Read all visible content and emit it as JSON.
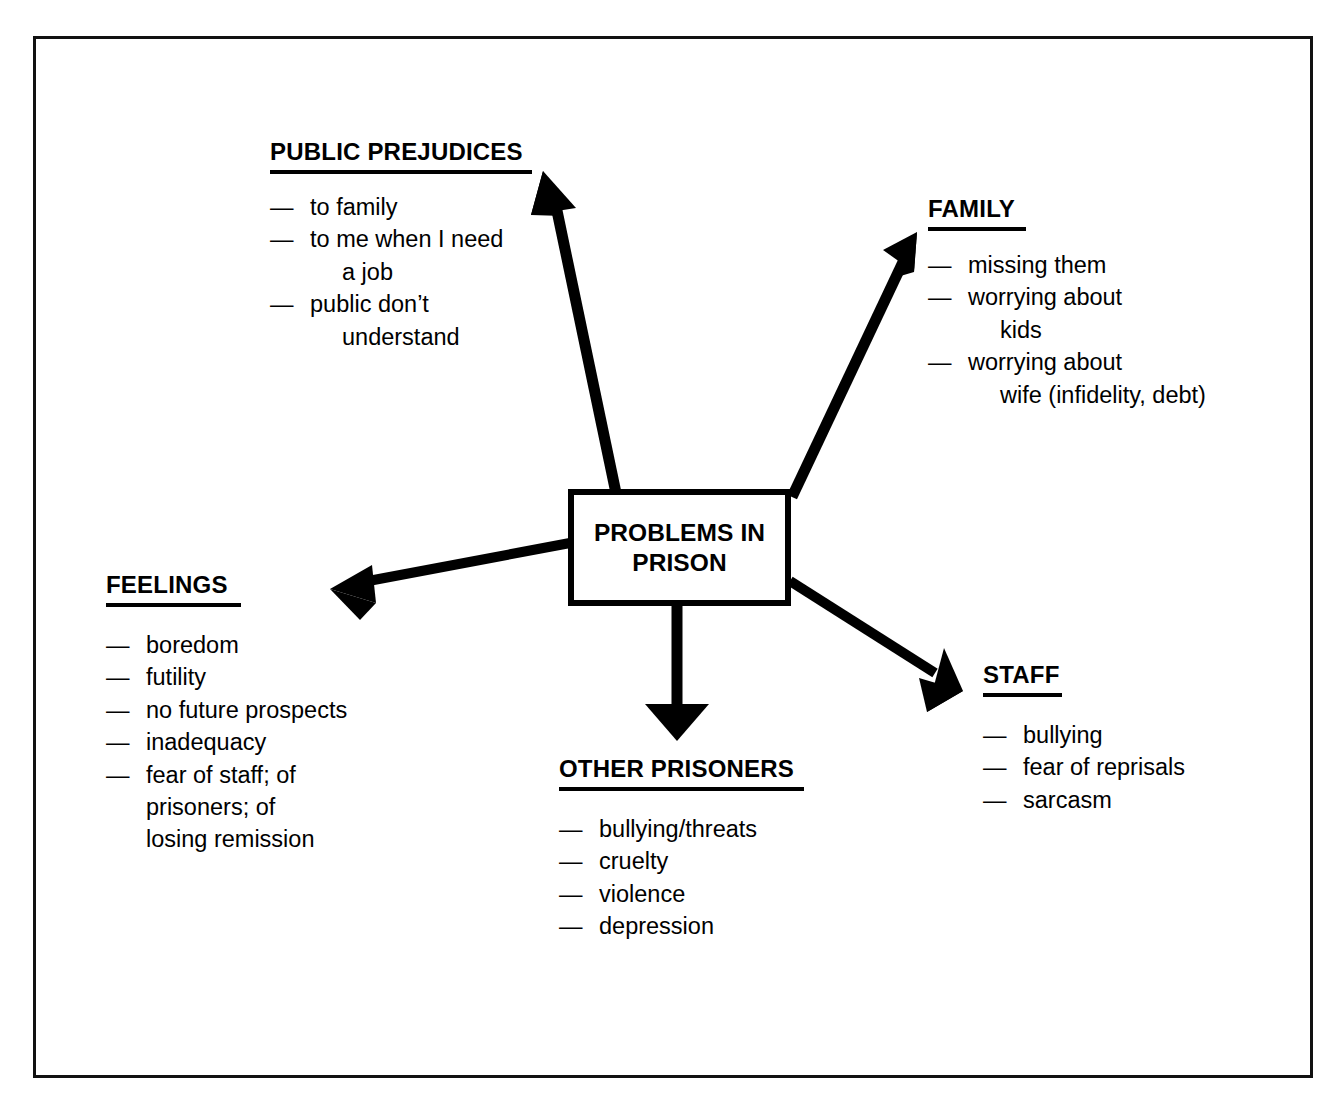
{
  "figure": {
    "top_caption": "",
    "central_node": {
      "label": "PROBLEMS IN\nPRISON"
    }
  },
  "branches": {
    "public_prejudices": {
      "heading": "PUBLIC PREJUDICES",
      "items": [
        "to family",
        "to me when I need\na job",
        "public don’t\nunderstand"
      ]
    },
    "family": {
      "heading": "FAMILY",
      "items": [
        "missing them",
        "worrying about\nkids",
        "worrying about\nwife (infidelity, debt)"
      ]
    },
    "feelings": {
      "heading": "FEELINGS",
      "items": [
        "boredom",
        "futility",
        "no future prospects",
        "inadequacy",
        "fear of staff; of\nprisoners; of\nlosing remission"
      ]
    },
    "other_prisoners": {
      "heading": "OTHER PRISONERS",
      "items": [
        "bullying/threats",
        "cruelty",
        "violence",
        "depression"
      ]
    },
    "staff": {
      "heading": "STAFF",
      "items": [
        "bullying",
        "fear of reprisals",
        "sarcasm"
      ]
    }
  },
  "bullet": {
    "dash": "—"
  },
  "diagram_data": {
    "type": "spider-diagram",
    "center": "PROBLEMS IN PRISON",
    "edge_count": 5,
    "edges": [
      {
        "to": "PUBLIC PREJUDICES",
        "direction": "up-left",
        "from": [
          615,
          492
        ],
        "tip": [
          543,
          172
        ]
      },
      {
        "to": "FAMILY",
        "direction": "up-right",
        "from": [
          793,
          497
        ],
        "tip": [
          917,
          232
        ]
      },
      {
        "to": "FEELINGS",
        "direction": "left",
        "from": [
          569,
          543
        ],
        "tip": [
          330,
          589
        ]
      },
      {
        "to": "OTHER PRISONERS",
        "direction": "down",
        "from": [
          677,
          604
        ],
        "tip": [
          677,
          741
        ]
      },
      {
        "to": "STAFF",
        "direction": "down-right",
        "from": [
          789,
          580
        ],
        "tip": [
          963,
          691
        ]
      }
    ],
    "colors": {
      "ink": "#000000",
      "background": "#ffffff",
      "frame": "#111111"
    }
  }
}
